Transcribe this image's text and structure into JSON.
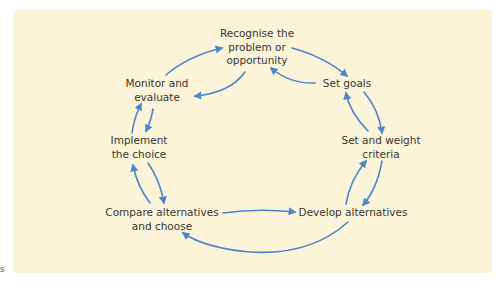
{
  "diagram": {
    "type": "cycle",
    "colors": {
      "background": "#fcf4d8",
      "arrow": "#4a86c8",
      "text": "#3a3530"
    },
    "nodes": [
      {
        "id": "recognise",
        "lines": [
          "Recognise the",
          "problem or",
          "opportunity"
        ]
      },
      {
        "id": "set-goals",
        "lines": [
          "Set goals"
        ]
      },
      {
        "id": "set-criteria",
        "lines": [
          "Set and weight",
          "criteria"
        ]
      },
      {
        "id": "develop",
        "lines": [
          "Develop alternatives"
        ]
      },
      {
        "id": "compare",
        "lines": [
          "Compare alternatives",
          "and choose"
        ]
      },
      {
        "id": "implement",
        "lines": [
          "Implement",
          "the choice"
        ]
      },
      {
        "id": "monitor",
        "lines": [
          "Monitor and",
          "evaluate"
        ]
      }
    ],
    "edges": [
      {
        "from": "recognise",
        "to": "set-goals"
      },
      {
        "from": "set-goals",
        "to": "recognise"
      },
      {
        "from": "set-goals",
        "to": "set-criteria"
      },
      {
        "from": "set-criteria",
        "to": "set-goals"
      },
      {
        "from": "set-criteria",
        "to": "develop"
      },
      {
        "from": "develop",
        "to": "set-criteria"
      },
      {
        "from": "compare",
        "to": "develop"
      },
      {
        "from": "develop",
        "to": "compare"
      },
      {
        "from": "compare",
        "to": "implement"
      },
      {
        "from": "implement",
        "to": "compare"
      },
      {
        "from": "implement",
        "to": "monitor"
      },
      {
        "from": "monitor",
        "to": "implement"
      },
      {
        "from": "monitor",
        "to": "recognise"
      },
      {
        "from": "recognise",
        "to": "monitor"
      }
    ]
  },
  "stray_text": "s"
}
